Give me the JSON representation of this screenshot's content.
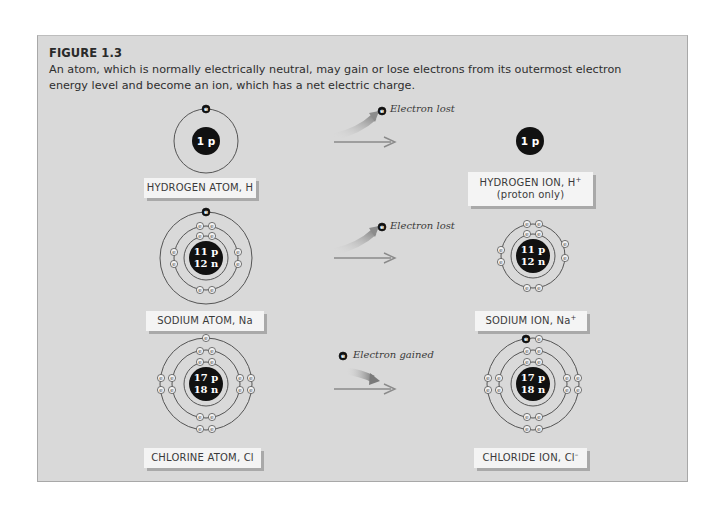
{
  "figure": {
    "title": "FIGURE 1.3",
    "caption": "An atom, which is normally electrically neutral, may gain or lose electrons from its outermost electron energy level and become an ion, which has a net electric charge.",
    "background_color": "#d9d9d9",
    "label_background": "#f4f4f4"
  },
  "rows": [
    {
      "atom": {
        "label": "HYDROGEN ATOM, H",
        "nucleus_lines": [
          "1 p"
        ],
        "shells": [
          1
        ],
        "highlighted_electron": "outer shell top"
      },
      "transition": {
        "note": "Electron lost",
        "direction": "lost"
      },
      "ion": {
        "label": "HYDROGEN ION, H",
        "label_superscript": "+",
        "sublabel": "(proton only)",
        "nucleus_lines": [
          "1 p"
        ],
        "shells": []
      }
    },
    {
      "atom": {
        "label": "SODIUM ATOM, Na",
        "nucleus_lines": [
          "11 p",
          "12 n"
        ],
        "shells": [
          2,
          8,
          1
        ],
        "highlighted_electron": "outer shell top"
      },
      "transition": {
        "note": "Electron lost",
        "direction": "lost"
      },
      "ion": {
        "label": "SODIUM ION, Na",
        "label_superscript": "+",
        "nucleus_lines": [
          "11 p",
          "12 n"
        ],
        "shells": [
          2,
          8
        ]
      }
    },
    {
      "atom": {
        "label": "CHLORINE ATOM, Cl",
        "nucleus_lines": [
          "17 p",
          "18 n"
        ],
        "shells": [
          2,
          8,
          7
        ]
      },
      "transition": {
        "note": "Electron gained",
        "direction": "gained"
      },
      "ion": {
        "label": "CHLORIDE ION, Cl",
        "label_superscript": "–",
        "nucleus_lines": [
          "17 p",
          "18 n"
        ],
        "shells": [
          2,
          8,
          8
        ],
        "highlighted_electron": "outer shell top-left"
      }
    }
  ],
  "electron_symbol": "e"
}
